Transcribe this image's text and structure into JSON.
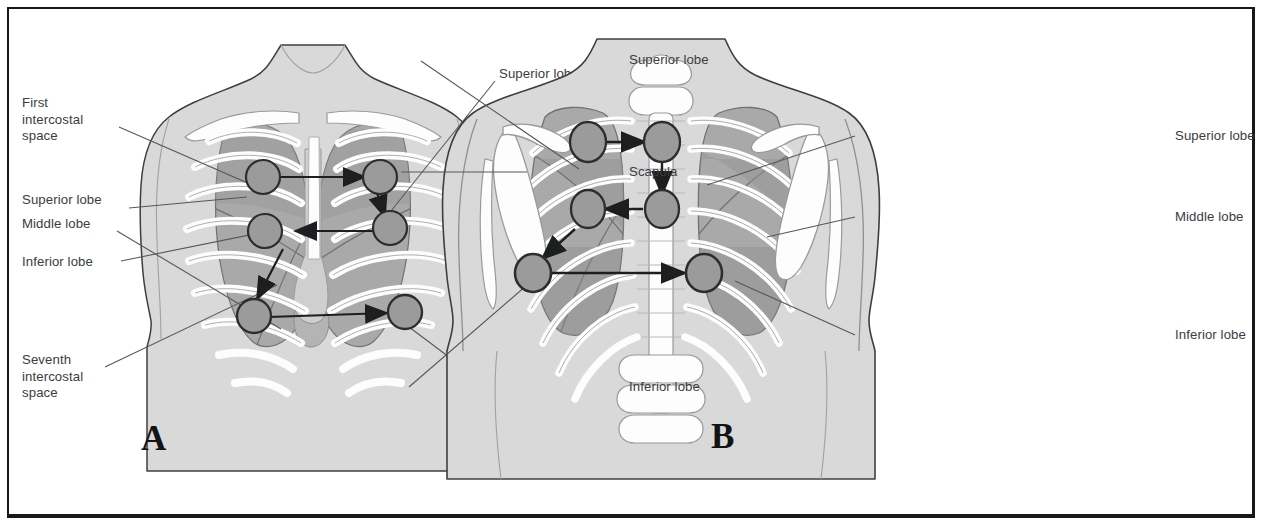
{
  "figure": {
    "panels": [
      {
        "id": "A",
        "letter": "A",
        "view": "anterior chest",
        "labels": [
          {
            "name": "first-intercostal-space",
            "text": "First\nintercostal\nspace",
            "side": "left"
          },
          {
            "name": "superior-lobe-left",
            "text": "Superior lobe",
            "side": "left"
          },
          {
            "name": "middle-lobe-left",
            "text": "Middle lobe",
            "side": "left"
          },
          {
            "name": "inferior-lobe-left",
            "text": "Inferior lobe",
            "side": "left"
          },
          {
            "name": "seventh-intercostal-space",
            "text": "Seventh\nintercostal\nspace",
            "side": "left"
          },
          {
            "name": "superior-lobe-right",
            "text": "Superior lobe",
            "side": "right"
          },
          {
            "name": "inferior-lobe-right",
            "text": "Inferior lobe",
            "side": "right"
          }
        ]
      },
      {
        "id": "B",
        "letter": "B",
        "view": "posterior chest",
        "labels": [
          {
            "name": "superior-lobe-left",
            "text": "Superior lobe",
            "side": "left"
          },
          {
            "name": "scapula",
            "text": "Scapula",
            "side": "left"
          },
          {
            "name": "inferior-lobe-left",
            "text": "Inferior lobe",
            "side": "left"
          },
          {
            "name": "superior-lobe-right",
            "text": "Superior lobe",
            "side": "right"
          },
          {
            "name": "middle-lobe-right",
            "text": "Middle lobe",
            "side": "right"
          },
          {
            "name": "inferior-lobe-right",
            "text": "Inferior lobe",
            "side": "right"
          }
        ]
      }
    ],
    "auscultation_sites_per_panel": 6,
    "colors": {
      "frame": "#16181a",
      "label_text": "#3a3d41",
      "torso": "#d9d9d9",
      "torso_outline": "#3c3f42",
      "lung": "#a9a9a9",
      "lung_dark": "#8f8f8f",
      "rib": "#fdfdfd",
      "rib_outline": "#9a9a9a",
      "site_fill": "#9b9b9b",
      "site_outline": "#2b2d2f",
      "arrow": "#1c1e20",
      "leader": "#55585c"
    }
  }
}
